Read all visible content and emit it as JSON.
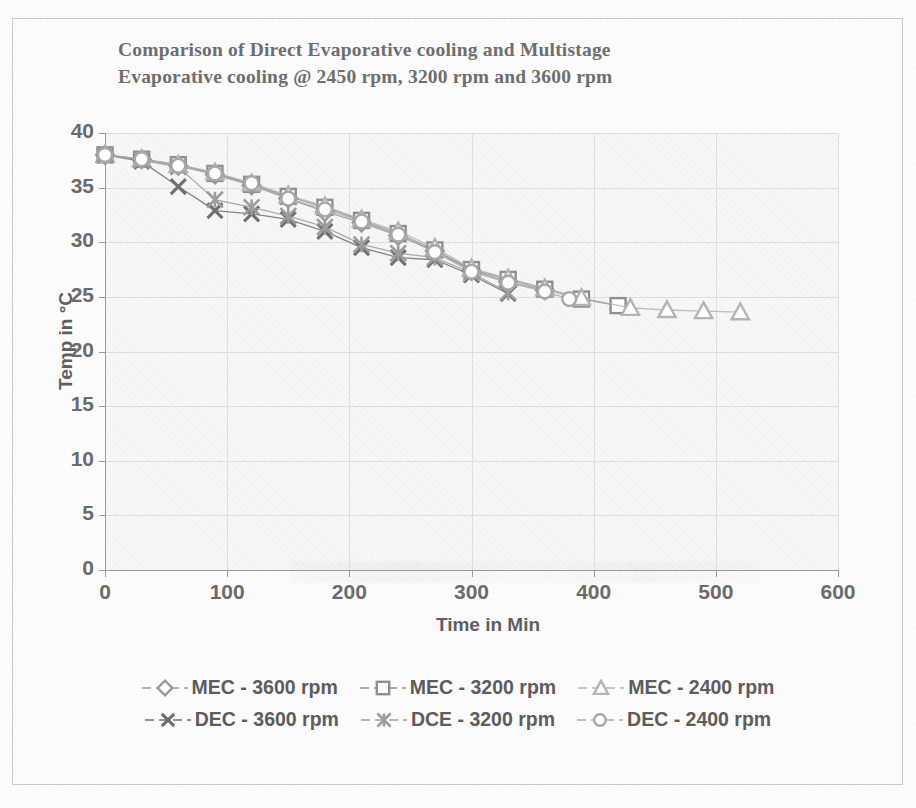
{
  "chart_data": {
    "type": "line",
    "title": "Comparison of Direct Evaporative cooling and Multistage Evaporative cooling @ 2450 rpm, 3200 rpm and 3600 rpm",
    "title_line1": "Comparison of Direct Evaporative cooling and Multistage",
    "title_line2": "Evaporative cooling @ 2450 rpm, 3200 rpm and 3600 rpm",
    "xlabel": "Time in Min",
    "ylabel": "Temp in °C",
    "xlim": [
      0,
      600
    ],
    "ylim": [
      0,
      40
    ],
    "xticks": [
      0,
      100,
      200,
      300,
      400,
      500,
      600
    ],
    "yticks": [
      0,
      5,
      10,
      15,
      20,
      25,
      30,
      35,
      40
    ],
    "grid": true,
    "legend_position": "bottom",
    "series": [
      {
        "name": "MEC - 3600 rpm",
        "marker": "diamond",
        "color": "#9a9a9a",
        "x": [
          0,
          30,
          60,
          90,
          120,
          150,
          180,
          210,
          240,
          270,
          300,
          330,
          360
        ],
        "y": [
          38.0,
          37.6,
          37.0,
          36.2,
          35.2,
          34.0,
          32.8,
          31.8,
          30.6,
          29.2,
          27.4,
          26.4,
          25.6
        ]
      },
      {
        "name": "MEC - 3200 rpm",
        "marker": "square",
        "color": "#8f8f8f",
        "x": [
          0,
          30,
          60,
          90,
          120,
          150,
          180,
          210,
          240,
          270,
          300,
          330,
          360,
          390,
          420
        ],
        "y": [
          38.0,
          37.6,
          37.1,
          36.3,
          35.3,
          34.2,
          33.2,
          32.0,
          30.8,
          29.3,
          27.5,
          26.6,
          25.7,
          24.8,
          24.2
        ]
      },
      {
        "name": "MEC - 2400 rpm",
        "marker": "triangle",
        "color": "#b4b4b4",
        "x": [
          0,
          30,
          60,
          90,
          120,
          150,
          180,
          210,
          240,
          270,
          300,
          330,
          360,
          390,
          430,
          460,
          490,
          520
        ],
        "y": [
          38.0,
          37.6,
          37.1,
          36.4,
          35.4,
          34.3,
          33.3,
          32.1,
          31.0,
          29.5,
          27.6,
          26.7,
          25.8,
          24.9,
          24.0,
          23.8,
          23.7,
          23.6
        ]
      },
      {
        "name": "DEC - 3600 rpm",
        "marker": "cross",
        "color": "#707070",
        "x": [
          0,
          30,
          60,
          90,
          120,
          150,
          180,
          210,
          240,
          270,
          300,
          330
        ],
        "y": [
          38.0,
          37.4,
          35.1,
          32.9,
          32.6,
          32.1,
          31.0,
          29.5,
          28.6,
          28.4,
          27.0,
          25.3
        ]
      },
      {
        "name": "DCE - 3200 rpm",
        "marker": "asterisk",
        "color": "#9c9c9c",
        "x": [
          0,
          30,
          60,
          90,
          120,
          150,
          180,
          210,
          240,
          270,
          300,
          330
        ],
        "y": [
          38.0,
          37.5,
          36.9,
          33.9,
          33.2,
          32.4,
          31.4,
          29.8,
          29.0,
          28.6,
          27.2,
          25.4
        ]
      },
      {
        "name": "DEC - 2400 rpm",
        "marker": "circle",
        "color": "#a8a8a8",
        "x": [
          0,
          30,
          60,
          90,
          120,
          150,
          180,
          210,
          240,
          270,
          300,
          330,
          360,
          380
        ],
        "y": [
          38.0,
          37.6,
          37.0,
          36.3,
          35.4,
          34.0,
          33.0,
          31.9,
          30.7,
          29.1,
          27.3,
          26.3,
          25.5,
          24.8
        ]
      }
    ]
  },
  "legend": {
    "row1": [
      {
        "label": "MEC - 3600 rpm",
        "marker": "diamond"
      },
      {
        "label": "MEC - 3200 rpm",
        "marker": "square"
      },
      {
        "label": "MEC - 2400 rpm",
        "marker": "triangle"
      }
    ],
    "row2": [
      {
        "label": "DEC - 3600 rpm",
        "marker": "cross"
      },
      {
        "label": "DCE - 3200 rpm",
        "marker": "asterisk"
      },
      {
        "label": "DEC - 2400 rpm",
        "marker": "circle"
      }
    ]
  },
  "colors": {
    "plot_background": "#f7f7f7",
    "gridline": "#dedede",
    "axis": "#9a9a9a",
    "title_text": "#6e6e6e",
    "tick_text": "#6b6b6b",
    "page_background": "#fcfcfc",
    "border": "#c9c9c9"
  }
}
